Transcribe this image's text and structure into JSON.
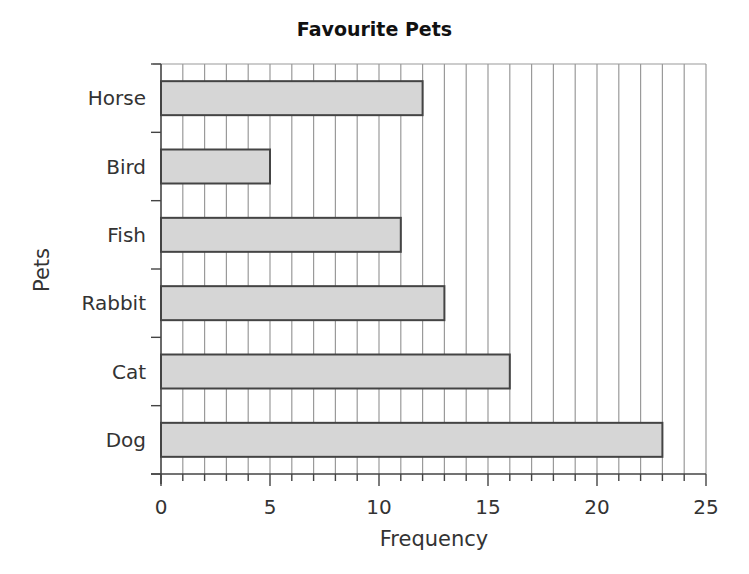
{
  "chart_data": {
    "type": "bar",
    "orientation": "horizontal",
    "title": "Favourite Pets",
    "xlabel": "Frequency",
    "ylabel": "Pets",
    "categories": [
      "Horse",
      "Bird",
      "Fish",
      "Rabbit",
      "Cat",
      "Dog"
    ],
    "values": [
      12,
      5,
      11,
      13,
      16,
      23
    ],
    "xlim": [
      0,
      25
    ],
    "x_ticks": [
      0,
      5,
      10,
      15,
      20,
      25
    ],
    "x_minor_step": 1,
    "grid": "vertical lines at every 1 unit",
    "legend": "none",
    "colors": {
      "bar_fill": "#d6d6d6",
      "bar_edge": "#444444",
      "grid": "#9a9a9a",
      "axis": "#444444"
    }
  }
}
